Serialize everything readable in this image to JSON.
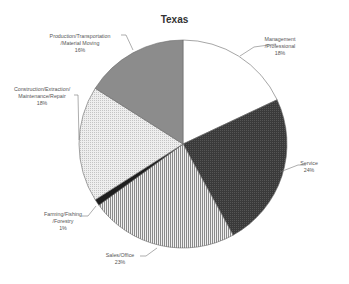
{
  "chart_data": {
    "type": "pie",
    "title": "Texas",
    "start_angle_deg": 0,
    "direction": "clockwise",
    "legend": "none (data labels with leader lines)",
    "slices": [
      {
        "label": "Management/Professional",
        "label_lines": [
          "Management",
          "/Professional",
          "18%"
        ],
        "value": 18,
        "fill": "#ffffff",
        "pattern": "solid"
      },
      {
        "label": "Service",
        "label_lines": [
          "Service",
          "24%"
        ],
        "value": 24,
        "fill": "#3a3a3a",
        "pattern": "fine-check"
      },
      {
        "label": "Sales/Office",
        "label_lines": [
          "Sales/Office",
          "23%"
        ],
        "value": 23,
        "fill": "#d8d8d8",
        "pattern": "vertical-stripes"
      },
      {
        "label": "Farming/Fishing/Forestry",
        "label_lines": [
          "Farming/Fishing",
          "/Forestry",
          "1%"
        ],
        "value": 1,
        "fill": "#1e1e1e",
        "pattern": "solid"
      },
      {
        "label": "Construction/Extraction/Maintenance/Repair",
        "label_lines": [
          "Construction/Extraction/",
          "Maintenance/Repair",
          "18%"
        ],
        "value": 18,
        "fill": "#e2e2e2",
        "pattern": "dots"
      },
      {
        "label": "Production/Transportation/Material Moving",
        "label_lines": [
          "Production/Transportation",
          "/Material Moving",
          "16%"
        ],
        "value": 16,
        "fill": "#8c8c8c",
        "pattern": "solid"
      }
    ]
  },
  "layout": {
    "center": [
      183,
      144
    ],
    "radius": 104,
    "labels": [
      {
        "x": 280,
        "y": 36,
        "leader": [
          [
            276,
            44
          ],
          [
            254,
            47
          ],
          [
            240,
            56
          ]
        ]
      },
      {
        "x": 309,
        "y": 160,
        "leader": [
          [
            306,
            165
          ],
          [
            298,
            165
          ],
          [
            280,
            172
          ]
        ]
      },
      {
        "x": 120,
        "y": 252,
        "leader": [
          [
            140,
            256
          ],
          [
            146,
            256
          ],
          [
            157,
            248
          ]
        ]
      },
      {
        "x": 63,
        "y": 211,
        "leader": [
          [
            82,
            216
          ],
          [
            88,
            216
          ],
          [
            96,
            206
          ]
        ]
      },
      {
        "x": 42,
        "y": 86,
        "leader": [
          [
            74,
            95
          ],
          [
            78,
            95
          ],
          [
            79,
            140
          ]
        ]
      },
      {
        "x": 80,
        "y": 33,
        "leader": [
          [
            121,
            35
          ],
          [
            126,
            35
          ],
          [
            133,
            50
          ]
        ]
      }
    ]
  }
}
